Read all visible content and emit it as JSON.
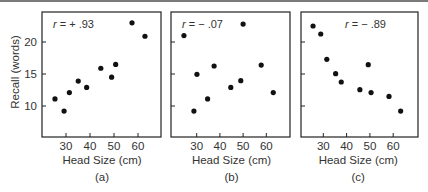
{
  "figure": {
    "ylabel": "Recall (words)",
    "xlabel": "Head Size (cm)"
  },
  "chart_data": [
    {
      "type": "scatter",
      "panel_label": "(a)",
      "annotation": "r = + .93",
      "annotation_r": "r",
      "annotation_rest": " = + .93",
      "title": "",
      "xlabel": "Head Size (cm)",
      "ylabel": "Recall (words)",
      "xticks": [
        30,
        40,
        50,
        60
      ],
      "yticks": [
        10,
        15,
        20
      ],
      "xlim": [
        20.5,
        69
      ],
      "ylim": [
        5.2,
        24.8
      ],
      "grid": false,
      "x": [
        25.4,
        29.2,
        31.4,
        35.1,
        38.6,
        44.5,
        49.0,
        50.7,
        57.5,
        62.9
      ],
      "y": [
        11.1,
        9.2,
        12.1,
        13.9,
        12.9,
        15.9,
        14.5,
        16.5,
        23.0,
        20.9
      ]
    },
    {
      "type": "scatter",
      "panel_label": "(b)",
      "annotation": "r = − .07",
      "annotation_r": "r",
      "annotation_rest": " = − .07",
      "title": "",
      "xlabel": "Head Size (cm)",
      "ylabel": "Recall (words)",
      "xticks": [
        30,
        40,
        50,
        60
      ],
      "yticks": [
        10,
        15,
        20
      ],
      "xlim": [
        19.2,
        70
      ],
      "ylim": [
        5.2,
        24.8
      ],
      "grid": false,
      "x": [
        24.5,
        28.8,
        30.1,
        34.7,
        37.5,
        44.7,
        49.0,
        50.0,
        57.8,
        63.0
      ],
      "y": [
        21.0,
        9.2,
        14.95,
        11.1,
        16.25,
        12.9,
        13.95,
        22.8,
        16.4,
        12.1
      ]
    },
    {
      "type": "scatter",
      "panel_label": "(c)",
      "annotation": "r = − .89",
      "annotation_r": "r",
      "annotation_rest": " = − .89",
      "title": "",
      "xlabel": "Head Size (cm)",
      "ylabel": "Recall (words)",
      "xticks": [
        30,
        40,
        50,
        60
      ],
      "yticks": [
        10,
        15,
        20
      ],
      "xlim": [
        20.2,
        70.8
      ],
      "ylim": [
        5.2,
        24.8
      ],
      "grid": false,
      "x": [
        25.6,
        28.9,
        31.5,
        35.3,
        37.7,
        45.7,
        49.3,
        50.5,
        58.2,
        63.2
      ],
      "y": [
        22.5,
        21.25,
        17.3,
        15.05,
        13.75,
        12.55,
        16.45,
        12.1,
        11.5,
        9.2
      ]
    }
  ],
  "layout": {
    "panels": [
      {
        "left": 42,
        "right": 161,
        "top": 12,
        "bottom": 137,
        "x30": 66,
        "pxPerCm": 2.4,
        "rx": 53
      },
      {
        "left": 171,
        "right": 290,
        "top": 12,
        "bottom": 137,
        "x30": 196.7,
        "pxPerCm": 2.32,
        "rx": 182
      },
      {
        "left": 301,
        "right": 418,
        "top": 12,
        "bottom": 137,
        "x30": 323.3,
        "pxPerCm": 2.33,
        "rx": 345
      }
    ],
    "y20": 42,
    "pxPerWord": 6.4,
    "colors": {
      "ink": "#111111",
      "text": "#333333",
      "rule": "#7a7a7a"
    }
  }
}
